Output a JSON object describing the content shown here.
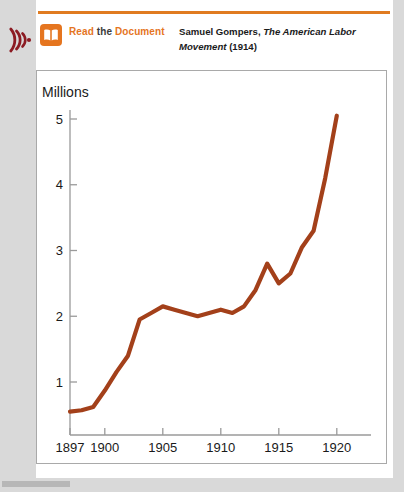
{
  "panel": {
    "audio_icon": "sound-wave-icon",
    "book_icon": "open-book-icon",
    "read_label_part1": "Read",
    "read_label_part2": "the",
    "read_label_part3": "Document",
    "citation_author": "Samuel Gompers,",
    "citation_title": "The American Labor Movement",
    "citation_year": "(1914)",
    "accent_color": "#e5751f",
    "rule_color": "#e07b20",
    "audio_icon_color": "#8c1b23"
  },
  "chart_data": {
    "type": "line",
    "title": "",
    "xlabel": "",
    "ylabel": "Millions",
    "ylim": [
      0,
      5.4
    ],
    "xlim": [
      1897,
      1921
    ],
    "grid": false,
    "legend": null,
    "line_color": "#a3401a",
    "x_ticks": [
      1897,
      1900,
      1905,
      1910,
      1915,
      1920
    ],
    "x_tick_labels": [
      "1897",
      "1900",
      "1905",
      "1910",
      "1915",
      "1920"
    ],
    "y_ticks": [
      1,
      2,
      3,
      4,
      5
    ],
    "y_tick_labels": [
      "1",
      "2",
      "3",
      "4",
      "5"
    ],
    "series": [
      {
        "name": "Union membership",
        "x": [
          1897,
          1898,
          1899,
          1900,
          1901,
          1902,
          1903,
          1904,
          1905,
          1906,
          1907,
          1908,
          1909,
          1910,
          1911,
          1912,
          1913,
          1914,
          1915,
          1916,
          1917,
          1918,
          1919,
          1920
        ],
        "values": [
          0.55,
          0.57,
          0.62,
          0.87,
          1.15,
          1.4,
          1.95,
          2.05,
          2.15,
          2.1,
          2.05,
          2.0,
          2.05,
          2.1,
          2.05,
          2.15,
          2.4,
          2.8,
          2.5,
          2.65,
          3.05,
          3.3,
          4.1,
          5.05
        ]
      }
    ]
  }
}
